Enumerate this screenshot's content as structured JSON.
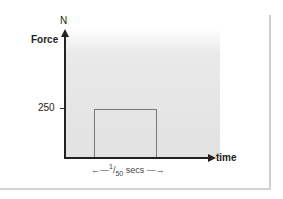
{
  "chart_data": {
    "type": "line",
    "title": "",
    "xlabel": "time",
    "ylabel": "Force",
    "y_unit": "N",
    "y_ticks": [
      250
    ],
    "shape": "rectangular pulse",
    "series": [
      {
        "name": "force",
        "x": [
          "0",
          "start",
          "start",
          "end",
          "end"
        ],
        "values": [
          0,
          0,
          250,
          250,
          0
        ]
      }
    ],
    "annotations": [
      {
        "text": "1/50 secs",
        "meaning": "pulse duration"
      }
    ]
  },
  "labels": {
    "unit": "N",
    "y_axis": "Force",
    "x_axis": "time",
    "tick_250": "250",
    "duration_num": "1",
    "duration_den": "50",
    "duration_unit": "secs"
  }
}
